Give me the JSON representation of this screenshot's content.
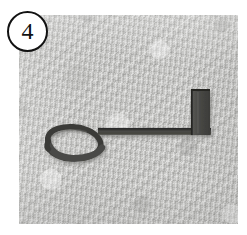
{
  "panel": {
    "number_label": "4",
    "badge_name": "circled-panel-number",
    "background_color": "#c6c6c4",
    "page_background_color": "#ffffff",
    "plate": {
      "left": 19,
      "top": 15,
      "width": 219,
      "height": 209,
      "texture_description": "rough granular plaster-like stone surface, light warm gray"
    }
  },
  "artifact": {
    "name": "hooked-iron-object",
    "description": "dark iron hook with a flat spiral scroll curl at the left end, a straight horizontal shaft, and an upright rectangular block at the right end",
    "stroke_color": "#3a3a38",
    "fill_color": "#4c4c4a",
    "shadow_color": "#9a9a97",
    "parts": [
      {
        "part_name": "spiral-scroll-curl",
        "position": "left"
      },
      {
        "part_name": "horizontal-shaft",
        "position": "center"
      },
      {
        "part_name": "vertical-block-terminal",
        "position": "right"
      }
    ]
  },
  "icons": {
    "badge_circle": "circle-outline-icon"
  }
}
